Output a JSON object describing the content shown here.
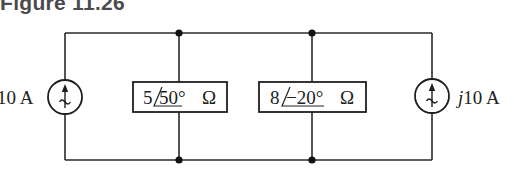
{
  "figure": {
    "title": "Figure 11.26"
  },
  "circuit": {
    "left_source": {
      "type": "ac-current-source",
      "label": "10 A",
      "direction": "up"
    },
    "impedance_1": {
      "magnitude": "5",
      "angle": "50°",
      "unit": "Ω"
    },
    "impedance_2": {
      "magnitude": "8",
      "angle": "−20°",
      "unit": "Ω"
    },
    "right_source": {
      "type": "ac-current-source",
      "label_prefix": "j",
      "label_value": "10 A",
      "direction": "up"
    },
    "topology": "parallel"
  },
  "colors": {
    "wire": "#2a2a2a",
    "title": "#4a4a4a",
    "background": "#ffffff"
  }
}
